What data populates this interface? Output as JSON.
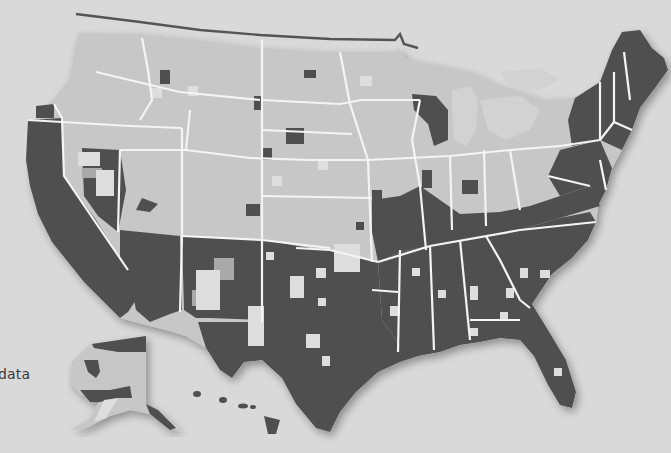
{
  "map": {
    "type": "choropleth",
    "subject": "United States by county (grayscale shading)",
    "shading_colors": {
      "dark": "#4f4f4f",
      "medium": "#a9a9a9",
      "light": "#c7c7c7",
      "lightest": "#dedede",
      "background": "#d9d9d9",
      "state_border": "#f4f4f4"
    },
    "regions_predominant_shade": {
      "Pacific (CA, OR coast)": "dark",
      "Southwest (AZ, NM, TX)": "dark",
      "Southeast (LA, MS, AL, GA, FL, SC, NC, TN, KY)": "dark",
      "Northeast (New England, NY, PA, NJ)": "dark",
      "Northern Plains & Mountain West": "light",
      "Great Lakes / Midwest": "light",
      "Alaska": "light with dark patches",
      "Hawaii": "dark"
    },
    "insets": [
      "Alaska",
      "Hawaii"
    ]
  },
  "legend": {
    "visible_fragment": "data"
  }
}
